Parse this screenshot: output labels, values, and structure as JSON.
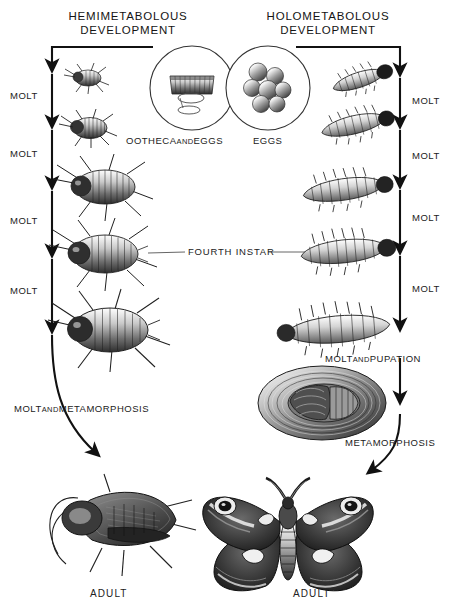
{
  "diagram": {
    "title_left": "HEMIMETABOLOUS\nDEVELOPMENT",
    "title_right": "HOLOMETABOLOUS\nDEVELOPMENT",
    "shared_label": "FOURTH  INSTAR"
  },
  "left_column": {
    "name": "hemimetabolous-development",
    "egg_stage_caption_main": "OOTHECA",
    "egg_stage_caption_and": "AND",
    "egg_stage_caption_tail": "EGGS",
    "molts": [
      {
        "label": "MOLT"
      },
      {
        "label": "MOLT"
      },
      {
        "label": "MOLT"
      },
      {
        "label": "MOLT"
      }
    ],
    "final_transition_main": "MOLT",
    "final_transition_and": "AND",
    "final_transition_tail": "METAMORPHOSIS",
    "adult_label": "ADULT",
    "stages": [
      {
        "name": "first-instar-nymph"
      },
      {
        "name": "second-instar-nymph"
      },
      {
        "name": "third-instar-nymph"
      },
      {
        "name": "fourth-instar-nymph"
      },
      {
        "name": "fifth-instar-nymph"
      },
      {
        "name": "adult-cockroach"
      }
    ]
  },
  "right_column": {
    "name": "holometabolous-development",
    "egg_stage_caption": "EGGS",
    "molts": [
      {
        "label": "MOLT"
      },
      {
        "label": "MOLT"
      },
      {
        "label": "MOLT"
      },
      {
        "label": "MOLT"
      }
    ],
    "pupation_main": "MOLT",
    "pupation_and": "AND",
    "pupation_tail": "PUPATION",
    "metamorphosis_label": "METAMORPHOSIS",
    "adult_label": "ADULT",
    "stages": [
      {
        "name": "first-instar-larva"
      },
      {
        "name": "second-instar-larva"
      },
      {
        "name": "third-instar-larva"
      },
      {
        "name": "fourth-instar-larva"
      },
      {
        "name": "fifth-instar-larva"
      },
      {
        "name": "cocoon-pupa"
      },
      {
        "name": "adult-moth"
      }
    ]
  },
  "colors": {
    "ink": "#1a1a1a",
    "paper": "#ffffff",
    "line": "#111111",
    "connector": "#555555",
    "shade_dark": "#2b2b2b",
    "shade_mid": "#767676",
    "shade_light": "#bdbdbd"
  }
}
